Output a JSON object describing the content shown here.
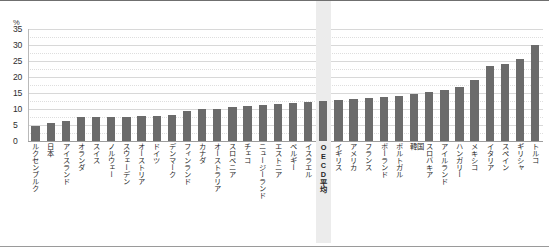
{
  "chart_data": {
    "type": "bar",
    "title": "",
    "xlabel": "",
    "ylabel": "",
    "unit_label": "%",
    "ylim": [
      0,
      35
    ],
    "yticks": [
      0,
      5,
      10,
      15,
      20,
      25,
      30,
      35
    ],
    "grid": true,
    "legend": "none",
    "bar_color": "#6b6b6b",
    "highlight_color": "#ececec",
    "highlight_category": "OECD平均",
    "categories": [
      "ルクセンブルク",
      "日本",
      "アイスランド",
      "オランダ",
      "スイス",
      "ノルウェー",
      "スウェーデン",
      "オーストリア",
      "ドイツ",
      "デンマーク",
      "フィンランド",
      "カナダ",
      "オーストラリア",
      "スロベニア",
      "チェコ",
      "ニュージーランド",
      "エストニア",
      "ベルギー",
      "イスラエル",
      "OECD平均",
      "イギリス",
      "アメリカ",
      "フランス",
      "ポーランド",
      "ポルトガル",
      "韓国",
      "スロバキア",
      "アイルランド",
      "ハンガリー",
      "メキシコ",
      "イタリア",
      "スペイン",
      "ギリシャ",
      "トルコ"
    ],
    "values": [
      4.7,
      5.6,
      6.3,
      7.4,
      7.4,
      7.5,
      7.5,
      7.8,
      7.9,
      8.0,
      9.3,
      10.0,
      10.1,
      10.6,
      11.0,
      11.2,
      11.6,
      11.9,
      12.2,
      12.6,
      12.8,
      13.0,
      13.3,
      13.8,
      14.2,
      14.8,
      15.3,
      15.8,
      17.0,
      19.0,
      23.4,
      24.2,
      25.6,
      30.0
    ],
    "short_labels": [
      "韓国"
    ]
  }
}
